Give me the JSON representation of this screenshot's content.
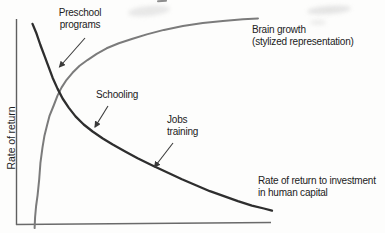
{
  "labels": {
    "y_axis": "Rate of return",
    "preschool": "Preschool\nprograms",
    "schooling": "Schooling",
    "jobs_training": "Jobs\ntraining",
    "brain_growth": "Brain growth\n(stylized representation)",
    "rate_of_return": "Rate of return to investment\nin human capital"
  },
  "colors": {
    "brain_curve": "#7b7b7b",
    "return_curve": "#2e2e2e",
    "axis": "#5f5f5f",
    "text": "#222222",
    "arrow": "#3a3a3a"
  },
  "chart_data": {
    "type": "line",
    "title": "",
    "xlabel": "",
    "ylabel": "Rate of return",
    "grid": false,
    "legend": false,
    "axis_ticks": false,
    "note_units": "points are [x,y] fractions of the unlabeled axis box (x: 0=origin, 1=right end; y: 0=x-axis, 1=top of y-axis)",
    "series": [
      {
        "name": "Brain growth (stylized representation)",
        "color": "#7b7b7b",
        "width": 2,
        "points": [
          [
            0.071,
            -0.015
          ],
          [
            0.073,
            0.039
          ],
          [
            0.077,
            0.092
          ],
          [
            0.083,
            0.145
          ],
          [
            0.089,
            0.222
          ],
          [
            0.094,
            0.3
          ],
          [
            0.102,
            0.377
          ],
          [
            0.11,
            0.435
          ],
          [
            0.12,
            0.483
          ],
          [
            0.13,
            0.531
          ],
          [
            0.146,
            0.58
          ],
          [
            0.161,
            0.628
          ],
          [
            0.177,
            0.667
          ],
          [
            0.197,
            0.705
          ],
          [
            0.22,
            0.739
          ],
          [
            0.248,
            0.773
          ],
          [
            0.28,
            0.802
          ],
          [
            0.315,
            0.831
          ],
          [
            0.354,
            0.858
          ],
          [
            0.402,
            0.882
          ],
          [
            0.453,
            0.903
          ],
          [
            0.512,
            0.925
          ],
          [
            0.579,
            0.947
          ],
          [
            0.654,
            0.966
          ],
          [
            0.732,
            0.981
          ],
          [
            0.811,
            0.991
          ],
          [
            0.89,
            0.999
          ],
          [
            0.949,
            1.003
          ]
        ]
      },
      {
        "name": "Rate of return to investment in human capital",
        "color": "#2e2e2e",
        "width": 2.3,
        "points": [
          [
            0.063,
            0.976
          ],
          [
            0.079,
            0.928
          ],
          [
            0.094,
            0.874
          ],
          [
            0.11,
            0.821
          ],
          [
            0.126,
            0.768
          ],
          [
            0.142,
            0.715
          ],
          [
            0.161,
            0.662
          ],
          [
            0.181,
            0.614
          ],
          [
            0.205,
            0.57
          ],
          [
            0.232,
            0.527
          ],
          [
            0.264,
            0.488
          ],
          [
            0.299,
            0.454
          ],
          [
            0.339,
            0.42
          ],
          [
            0.378,
            0.391
          ],
          [
            0.425,
            0.358
          ],
          [
            0.476,
            0.324
          ],
          [
            0.532,
            0.29
          ],
          [
            0.591,
            0.256
          ],
          [
            0.65,
            0.222
          ],
          [
            0.705,
            0.193
          ],
          [
            0.76,
            0.164
          ],
          [
            0.815,
            0.14
          ],
          [
            0.87,
            0.116
          ],
          [
            0.925,
            0.094
          ],
          [
            0.972,
            0.08
          ],
          [
            1.004,
            0.07
          ]
        ]
      }
    ],
    "annotations": [
      {
        "label": "Preschool programs",
        "points_to": "return curve, upper left"
      },
      {
        "label": "Schooling",
        "points_to": "return curve, middle"
      },
      {
        "label": "Jobs training",
        "points_to": "return curve, lower right"
      }
    ]
  }
}
